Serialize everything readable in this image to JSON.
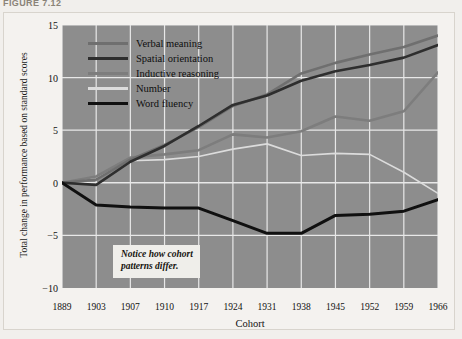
{
  "figure": {
    "caption": "FIGURE 7.12"
  },
  "annotation": {
    "text": "Notice how cohort\npatterns differ."
  },
  "chart_data": {
    "type": "line",
    "title": "",
    "xlabel": "Cohort",
    "ylabel": "Total change in performance based on standard scores",
    "categories": [
      "1889",
      "1903",
      "1907",
      "1910",
      "1917",
      "1924",
      "1931",
      "1938",
      "1945",
      "1952",
      "1959",
      "1966"
    ],
    "ylim": [
      -10,
      15
    ],
    "yticks": [
      15,
      10,
      5,
      0,
      -5,
      -10
    ],
    "ytick_labels": [
      "15",
      "10",
      "5",
      "0",
      "−5",
      "−10"
    ],
    "grid": true,
    "legend_position": "upper-left-inside",
    "plot_background": "#8d8d8d",
    "gridline_color": "#e8e8e8",
    "series": [
      {
        "name": "Verbal meaning",
        "color": "#6f6f6f",
        "width": 2.6,
        "values": [
          0,
          0.3,
          2.2,
          3.6,
          5.3,
          7.3,
          8.4,
          10.4,
          11.4,
          12.2,
          12.9,
          14.0
        ]
      },
      {
        "name": "Spatial orientation",
        "color": "#2e2e2e",
        "width": 2.6,
        "values": [
          0,
          -0.2,
          2.0,
          3.5,
          5.4,
          7.4,
          8.3,
          9.7,
          10.6,
          11.2,
          11.9,
          13.1
        ]
      },
      {
        "name": "Inductive reasoning",
        "color": "#7d7d7d",
        "width": 2.6,
        "values": [
          0,
          0.6,
          2.4,
          2.7,
          3.1,
          4.6,
          4.3,
          4.9,
          6.3,
          5.9,
          6.8,
          10.5
        ]
      },
      {
        "name": "Number",
        "color": "#dcdcdc",
        "width": 1.6,
        "values": [
          0,
          0.5,
          2.1,
          2.2,
          2.5,
          3.2,
          3.7,
          2.6,
          2.8,
          2.7,
          1.0,
          -1.0
        ]
      },
      {
        "name": "Word fluency",
        "color": "#101010",
        "width": 3.0,
        "values": [
          0,
          -2.1,
          -2.3,
          -2.4,
          -2.4,
          -3.6,
          -4.8,
          -4.8,
          -3.1,
          -3.0,
          -2.7,
          -1.6
        ]
      }
    ]
  }
}
